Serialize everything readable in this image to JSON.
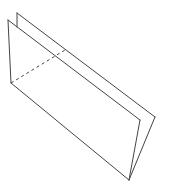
{
  "diagram": {
    "type": "line-drawing",
    "stroke_color": "#444444",
    "background": "#ffffff",
    "front_panel": {
      "points": [
        [
          8,
          20
        ],
        [
          140,
          120
        ],
        [
          129,
          180
        ],
        [
          11,
          83
        ]
      ]
    },
    "back_panel": {
      "points": [
        [
          17,
          13
        ],
        [
          155,
          117
        ],
        [
          129,
          180
        ]
      ],
      "left_edge": [
        [
          17,
          13
        ],
        [
          17,
          27
        ]
      ]
    },
    "hidden_edge": {
      "style": "dashed",
      "from": [
        11,
        83
      ],
      "to": [
        65,
        50
      ]
    }
  }
}
